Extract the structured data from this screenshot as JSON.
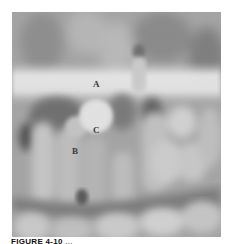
{
  "figure": {
    "labels": {
      "a": "A",
      "b": "B",
      "c": "C"
    },
    "caption": {
      "number": "FIGURE 4-10",
      "text": " ..."
    }
  }
}
